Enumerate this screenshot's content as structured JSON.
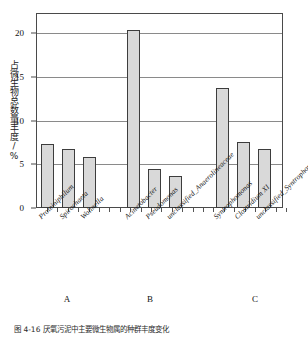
{
  "chart_data": {
    "type": "bar",
    "title": "",
    "subtitle": "",
    "xlabel": "",
    "ylabel": "占微生物总数量丰度/%",
    "ylim": [
      0,
      22.3
    ],
    "yticks": [
      0,
      5,
      10,
      15,
      20
    ],
    "grid": true,
    "legend": null,
    "categories": [
      "Proteiniphilum",
      "Spirochaeta",
      "Wolinella",
      "Acinetobacter",
      "Pseudomonas",
      "unclassified_Anaerolineaceae",
      "Syntrophomonas",
      "Clostridium XI",
      "unclassified_Syntrophomonadaceae"
    ],
    "values": [
      7.3,
      6.8,
      5.8,
      20.4,
      4.5,
      3.7,
      13.7,
      7.5,
      6.7
    ],
    "groups": [
      {
        "label": "A",
        "categories": [
          "Proteiniphilum",
          "Spirochaeta",
          "Wolinella"
        ]
      },
      {
        "label": "B",
        "categories": [
          "Acinetobacter",
          "Pseudomonas",
          "unclassified_Anaerolineaceae"
        ]
      },
      {
        "label": "C",
        "categories": [
          "Syntrophomonas",
          "Clostridium XI",
          "unclassified_Syntrophomonadaceae"
        ]
      }
    ],
    "bar_fill_color": "#d9d9d9",
    "bar_edge_color": "#3d3d3d",
    "grid_color": "#8a8a8a"
  },
  "axis": {
    "ylabel": "占微生物总数量丰度/%",
    "ytick_labels": [
      "0",
      "5",
      "10",
      "15",
      "20"
    ]
  },
  "groups": {
    "a": "A",
    "b": "B",
    "c": "C"
  },
  "caption": {
    "text": "图 4-16  厌氧污泥中主要微生物属的种群丰度变化"
  }
}
